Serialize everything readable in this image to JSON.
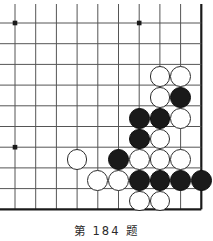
{
  "figure": {
    "kind": "go-problem-diagram",
    "caption": "第 184 题"
  },
  "board": {
    "line_color": "#555555",
    "edge_color": "#1a1a1a",
    "star_color": "#1a1a1a",
    "background": "#ffffff",
    "cell_size": 20.7,
    "origin_x": 15,
    "origin_y": 23,
    "columns": 10,
    "rows": 10,
    "edges_drawn": [
      "right",
      "bottom"
    ],
    "star_points": [
      {
        "col": 0,
        "row": 0
      },
      {
        "col": 6,
        "row": 0
      },
      {
        "col": 0,
        "row": 6
      }
    ]
  },
  "stones": {
    "black_color": "#1a1a1a",
    "white_color": "#ffffff",
    "radius": 10.4,
    "black_count": 13,
    "white_count": 14,
    "list": [
      {
        "color": "white",
        "col": 7,
        "row": 2.6
      },
      {
        "color": "white",
        "col": 8,
        "row": 2.6
      },
      {
        "color": "white",
        "col": 7,
        "row": 3.6
      },
      {
        "color": "black",
        "col": 8,
        "row": 3.6
      },
      {
        "color": "black",
        "col": 6,
        "row": 4.6
      },
      {
        "color": "black",
        "col": 7,
        "row": 4.6
      },
      {
        "color": "white",
        "col": 8,
        "row": 4.6
      },
      {
        "color": "black",
        "col": 6,
        "row": 5.6
      },
      {
        "color": "white",
        "col": 7,
        "row": 5.6
      },
      {
        "color": "white",
        "col": 3,
        "row": 6.6
      },
      {
        "color": "black",
        "col": 5,
        "row": 6.6
      },
      {
        "color": "white",
        "col": 6,
        "row": 6.6
      },
      {
        "color": "white",
        "col": 7,
        "row": 6.6
      },
      {
        "color": "white",
        "col": 8,
        "row": 6.6
      },
      {
        "color": "white",
        "col": 4,
        "row": 7.6
      },
      {
        "color": "white",
        "col": 5,
        "row": 7.6
      },
      {
        "color": "black",
        "col": 6,
        "row": 7.6
      },
      {
        "color": "black",
        "col": 7,
        "row": 7.6
      },
      {
        "color": "black",
        "col": 8,
        "row": 7.6
      },
      {
        "color": "black",
        "col": 9,
        "row": 7.6
      },
      {
        "color": "white",
        "col": 6,
        "row": 8.6
      },
      {
        "color": "white",
        "col": 7,
        "row": 8.6
      }
    ]
  }
}
